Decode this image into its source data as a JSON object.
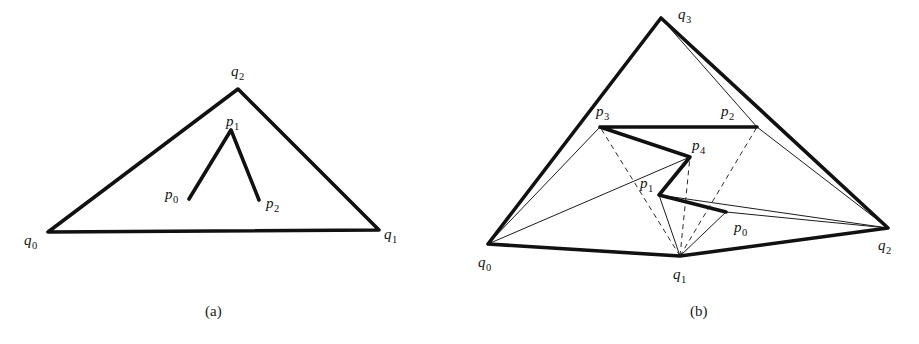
{
  "figure": {
    "background": "#ffffff",
    "ink_color": "#111111",
    "width": 919,
    "height": 344
  },
  "panels": [
    {
      "id": "panel-a",
      "caption": "(a)",
      "caption_pos": [
        205,
        316
      ],
      "outer_polygon": {
        "name": "triangle-q",
        "style": "thick",
        "closed": true,
        "vertices": [
          [
            48,
            232
          ],
          [
            379,
            230
          ],
          [
            238,
            89
          ]
        ]
      },
      "chain": {
        "name": "polyline-p",
        "style": "thick",
        "closed": false,
        "vertices": [
          [
            189,
            199
          ],
          [
            231,
            130
          ],
          [
            259,
            200
          ]
        ]
      },
      "labels": [
        {
          "name": "label-q0",
          "base": "q",
          "sub": "0",
          "x": 24,
          "y": 245
        },
        {
          "name": "label-q1",
          "base": "q",
          "sub": "1",
          "x": 384,
          "y": 239
        },
        {
          "name": "label-q2",
          "base": "q",
          "sub": "2",
          "x": 231,
          "y": 76
        },
        {
          "name": "label-p0",
          "base": "p",
          "sub": "0",
          "x": 165,
          "y": 199
        },
        {
          "name": "label-p1",
          "base": "p",
          "sub": "1",
          "x": 226,
          "y": 126
        },
        {
          "name": "label-p2",
          "base": "p",
          "sub": "2",
          "x": 266,
          "y": 208
        }
      ]
    },
    {
      "id": "panel-b",
      "caption": "(b)",
      "caption_pos": [
        690,
        316
      ],
      "outer_polygon": {
        "name": "quad-q",
        "style": "thick",
        "closed": true,
        "vertices": [
          [
            488,
            244
          ],
          [
            680,
            256
          ],
          [
            888,
            228
          ],
          [
            661,
            18
          ]
        ]
      },
      "chain": {
        "name": "polyline-p",
        "style": "thick",
        "closed": false,
        "vertices": [
          [
            726,
            212
          ],
          [
            659,
            195
          ],
          [
            690,
            157
          ],
          [
            600,
            127
          ],
          [
            757,
            127
          ]
        ]
      },
      "thin_edges": [
        {
          "name": "edge-q0-p3",
          "from": [
            488,
            244
          ],
          "to": [
            600,
            127
          ]
        },
        {
          "name": "edge-q0-p4",
          "from": [
            488,
            244
          ],
          "to": [
            690,
            157
          ]
        },
        {
          "name": "edge-q0-q3",
          "from": [
            488,
            244
          ],
          "to": [
            661,
            18
          ]
        },
        {
          "name": "edge-q3-p2",
          "from": [
            661,
            18
          ],
          "to": [
            757,
            127
          ]
        },
        {
          "name": "edge-q2-p2",
          "from": [
            888,
            228
          ],
          "to": [
            757,
            127
          ]
        },
        {
          "name": "edge-q2-p1",
          "from": [
            888,
            228
          ],
          "to": [
            659,
            195
          ]
        },
        {
          "name": "edge-q2-p0",
          "from": [
            888,
            228
          ],
          "to": [
            726,
            212
          ]
        },
        {
          "name": "edge-q1-p1",
          "from": [
            680,
            256
          ],
          "to": [
            659,
            195
          ]
        },
        {
          "name": "edge-q1-p0",
          "from": [
            680,
            256
          ],
          "to": [
            726,
            212
          ]
        }
      ],
      "dashed_edges": [
        {
          "name": "dash-q1-p3",
          "from": [
            680,
            256
          ],
          "to": [
            600,
            127
          ]
        },
        {
          "name": "dash-q1-p4",
          "from": [
            680,
            256
          ],
          "to": [
            690,
            157
          ]
        },
        {
          "name": "dash-q1-p2",
          "from": [
            680,
            256
          ],
          "to": [
            757,
            127
          ]
        }
      ],
      "labels": [
        {
          "name": "label-q0",
          "base": "q",
          "sub": "0",
          "x": 478,
          "y": 267
        },
        {
          "name": "label-q1",
          "base": "q",
          "sub": "1",
          "x": 673,
          "y": 279
        },
        {
          "name": "label-q2",
          "base": "q",
          "sub": "2",
          "x": 878,
          "y": 250
        },
        {
          "name": "label-q3",
          "base": "q",
          "sub": "3",
          "x": 678,
          "y": 19
        },
        {
          "name": "label-p0",
          "base": "p",
          "sub": "0",
          "x": 734,
          "y": 232
        },
        {
          "name": "label-p1",
          "base": "p",
          "sub": "1",
          "x": 640,
          "y": 188
        },
        {
          "name": "label-p2",
          "base": "p",
          "sub": "2",
          "x": 721,
          "y": 116
        },
        {
          "name": "label-p3",
          "base": "p",
          "sub": "3",
          "x": 596,
          "y": 116
        },
        {
          "name": "label-p4",
          "base": "p",
          "sub": "4",
          "x": 692,
          "y": 150
        }
      ]
    }
  ]
}
